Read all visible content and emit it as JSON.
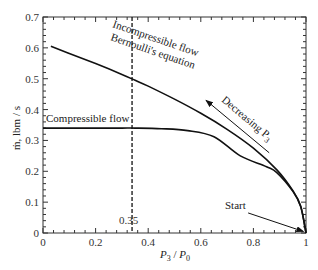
{
  "chart_data": {
    "type": "line",
    "title": "",
    "xlabel": "P3 / P0",
    "ylabel": "ṁ, lbm / s",
    "xlim": [
      0,
      1
    ],
    "ylim": [
      0,
      0.7
    ],
    "grid": false,
    "legend": "none (inline annotations)",
    "xticks": [
      0,
      0.2,
      0.4,
      0.6,
      0.8,
      1
    ],
    "xtick_labels": [
      "0",
      "0.2",
      "0.4",
      "0.6",
      "0.8",
      "1"
    ],
    "yticks": [
      0,
      0.1,
      0.2,
      0.3,
      0.4,
      0.5,
      0.6,
      0.7
    ],
    "ytick_labels": [
      "0",
      "0.1",
      "0.2",
      "0.3",
      "0.4",
      "0.5",
      "0.6",
      "0.7"
    ],
    "series": [
      {
        "name": "Incompressible flow Bernoulli's equation",
        "x": [
          0.03,
          0.1,
          0.2,
          0.3,
          0.35,
          0.4,
          0.5,
          0.6,
          0.7,
          0.8,
          0.89,
          0.95,
          0.98,
          1.0
        ],
        "y": [
          0.605,
          0.582,
          0.549,
          0.514,
          0.495,
          0.476,
          0.434,
          0.388,
          0.336,
          0.275,
          0.204,
          0.137,
          0.087,
          0.0
        ]
      },
      {
        "name": "Compressible flow",
        "x": [
          0.0,
          0.1,
          0.2,
          0.3,
          0.35,
          0.45,
          0.55,
          0.65,
          0.75,
          0.85,
          0.89,
          0.95,
          0.98,
          1.0
        ],
        "y": [
          0.34,
          0.34,
          0.34,
          0.34,
          0.34,
          0.338,
          0.332,
          0.312,
          0.25,
          0.215,
          0.195,
          0.135,
          0.086,
          0.0
        ]
      }
    ],
    "annotations": [
      {
        "text": "Incompressible flow",
        "x": 0.3,
        "y": 0.62
      },
      {
        "text": "Bernoulli's equation",
        "x": 0.3,
        "y": 0.575
      },
      {
        "text": "Compressible flow",
        "x": 0.03,
        "y": 0.36
      },
      {
        "text": "Decreasing P3",
        "arrow_from": [
          0.86,
          0.26
        ],
        "arrow_to": [
          0.62,
          0.43
        ]
      },
      {
        "text": "Start",
        "arrow_from": [
          0.78,
          0.065
        ],
        "arrow_to": [
          0.99,
          0.005
        ]
      },
      {
        "text": "0.35",
        "x": 0.35,
        "y": 0.03,
        "vline": 0.35,
        "style": "dashed"
      }
    ]
  },
  "labels": {
    "xlabel_main": "P",
    "xlabel_sub1": "3",
    "xlabel_slash": " / ",
    "xlabel_main2": "P",
    "xlabel_sub2": "0",
    "ylabel": "ṁ, lbm / s",
    "incompressible_1": "Incompressible flow",
    "incompressible_2": "Bernoulli's equation",
    "compressible": "Compressible flow",
    "decreasing": "Decreasing P",
    "decreasing_sub": "3",
    "start": "Start",
    "vline_label": "0.35"
  },
  "colors": {
    "curve": "#111111",
    "axis": "#333333",
    "background": "#ffffff"
  }
}
